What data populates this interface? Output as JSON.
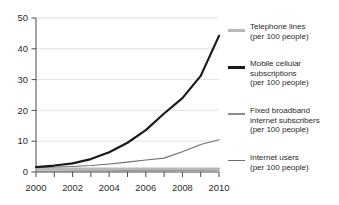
{
  "chart_data": {
    "type": "line",
    "title": "",
    "subtitle": "",
    "xlabel": "",
    "ylabel": "",
    "x": [
      2000,
      2001,
      2002,
      2003,
      2004,
      2005,
      2006,
      2007,
      2008,
      2009,
      2010
    ],
    "xlim": [
      2000,
      2010
    ],
    "ylim": [
      0,
      50
    ],
    "grid": true,
    "grid_axis": "y",
    "legend_position": "right",
    "x_tick_labels": [
      "2000",
      "2002",
      "2004",
      "2006",
      "2008",
      "2010"
    ],
    "x_tick_values": [
      2000,
      2002,
      2004,
      2006,
      2008,
      2010
    ],
    "x_minor_ticks": [
      2000,
      2001,
      2002,
      2003,
      2004,
      2005,
      2006,
      2007,
      2008,
      2009,
      2010
    ],
    "y_tick_labels": [
      "0",
      "10",
      "20",
      "30",
      "40",
      "50"
    ],
    "y_tick_values": [
      0,
      10,
      20,
      30,
      40,
      50
    ],
    "series": [
      {
        "name": "Telephone lines",
        "unit": "(per 100 people)",
        "color": "#b9b9b9",
        "width": 2.6,
        "values": [
          1.0,
          1.0,
          1.0,
          1.0,
          1.0,
          1.0,
          1.0,
          1.0,
          1.0,
          1.0,
          1.0
        ]
      },
      {
        "name": "Mobile cellular subscriptions",
        "unit": "(per 100 people)",
        "color": "#1a1a1a",
        "width": 2.2,
        "values": [
          1.6,
          2.1,
          2.8,
          4.2,
          6.4,
          9.5,
          13.6,
          19.0,
          24.0,
          31.2,
          44.2
        ]
      },
      {
        "name": "Fixed broadband internet subscribers",
        "unit": "(per 100 people)",
        "color": "#8c8c8c",
        "width": 1.5,
        "values": [
          0.25,
          0.25,
          0.3,
          0.3,
          0.35,
          0.4,
          0.45,
          0.5,
          0.55,
          0.6,
          0.65
        ]
      },
      {
        "name": "Internet users",
        "unit": "(per 100 people)",
        "color": "#707070",
        "width": 1.1,
        "values": [
          1.5,
          1.6,
          1.8,
          2.1,
          2.6,
          3.2,
          3.9,
          4.5,
          6.6,
          8.9,
          10.5
        ]
      }
    ]
  },
  "legend": {
    "items": [
      {
        "label": "Telephone lines",
        "unit": "(per 100 people)",
        "swatch_color": "#b9b9b9",
        "swatch_height": "3px"
      },
      {
        "label": "Mobile cellular",
        "label2": "subscriptions",
        "unit": "(per 100 people)",
        "swatch_color": "#1a1a1a",
        "swatch_height": "2.6px"
      },
      {
        "label": "Fixed broadband",
        "label2": "internet subscribers",
        "unit": "(per 100 people)",
        "swatch_color": "#8c8c8c",
        "swatch_height": "1.8px"
      },
      {
        "label": "Internet users",
        "unit": "(per 100 people)",
        "swatch_color": "#707070",
        "swatch_height": "1.2px"
      }
    ]
  },
  "axes": {
    "y_labels": [
      "50",
      "40",
      "30",
      "20",
      "10",
      "0"
    ],
    "x_labels": [
      "2000",
      "2002",
      "2004",
      "2006",
      "2008",
      "2010"
    ]
  }
}
